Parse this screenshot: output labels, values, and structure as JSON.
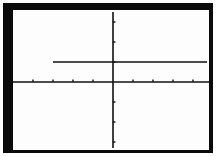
{
  "chart_data": {
    "type": "line",
    "title": "",
    "xlabel": "",
    "ylabel": "",
    "xlim": [
      -5,
      5
    ],
    "ylim": [
      -3.5,
      3.5
    ],
    "x_ticks": [
      -4,
      -3,
      -2,
      -1,
      1,
      2,
      3,
      4
    ],
    "y_ticks": [
      -3,
      -2,
      -1,
      1,
      2,
      3
    ],
    "grid": false,
    "legend": null,
    "series": [
      {
        "name": "y = 1 (x ≥ -3)",
        "x": [
          -3,
          4.7
        ],
        "y": [
          1,
          1
        ]
      }
    ]
  },
  "colors": {
    "frame": "#0a0a0a",
    "background": "#fdfdfd",
    "ink": "#111111"
  }
}
